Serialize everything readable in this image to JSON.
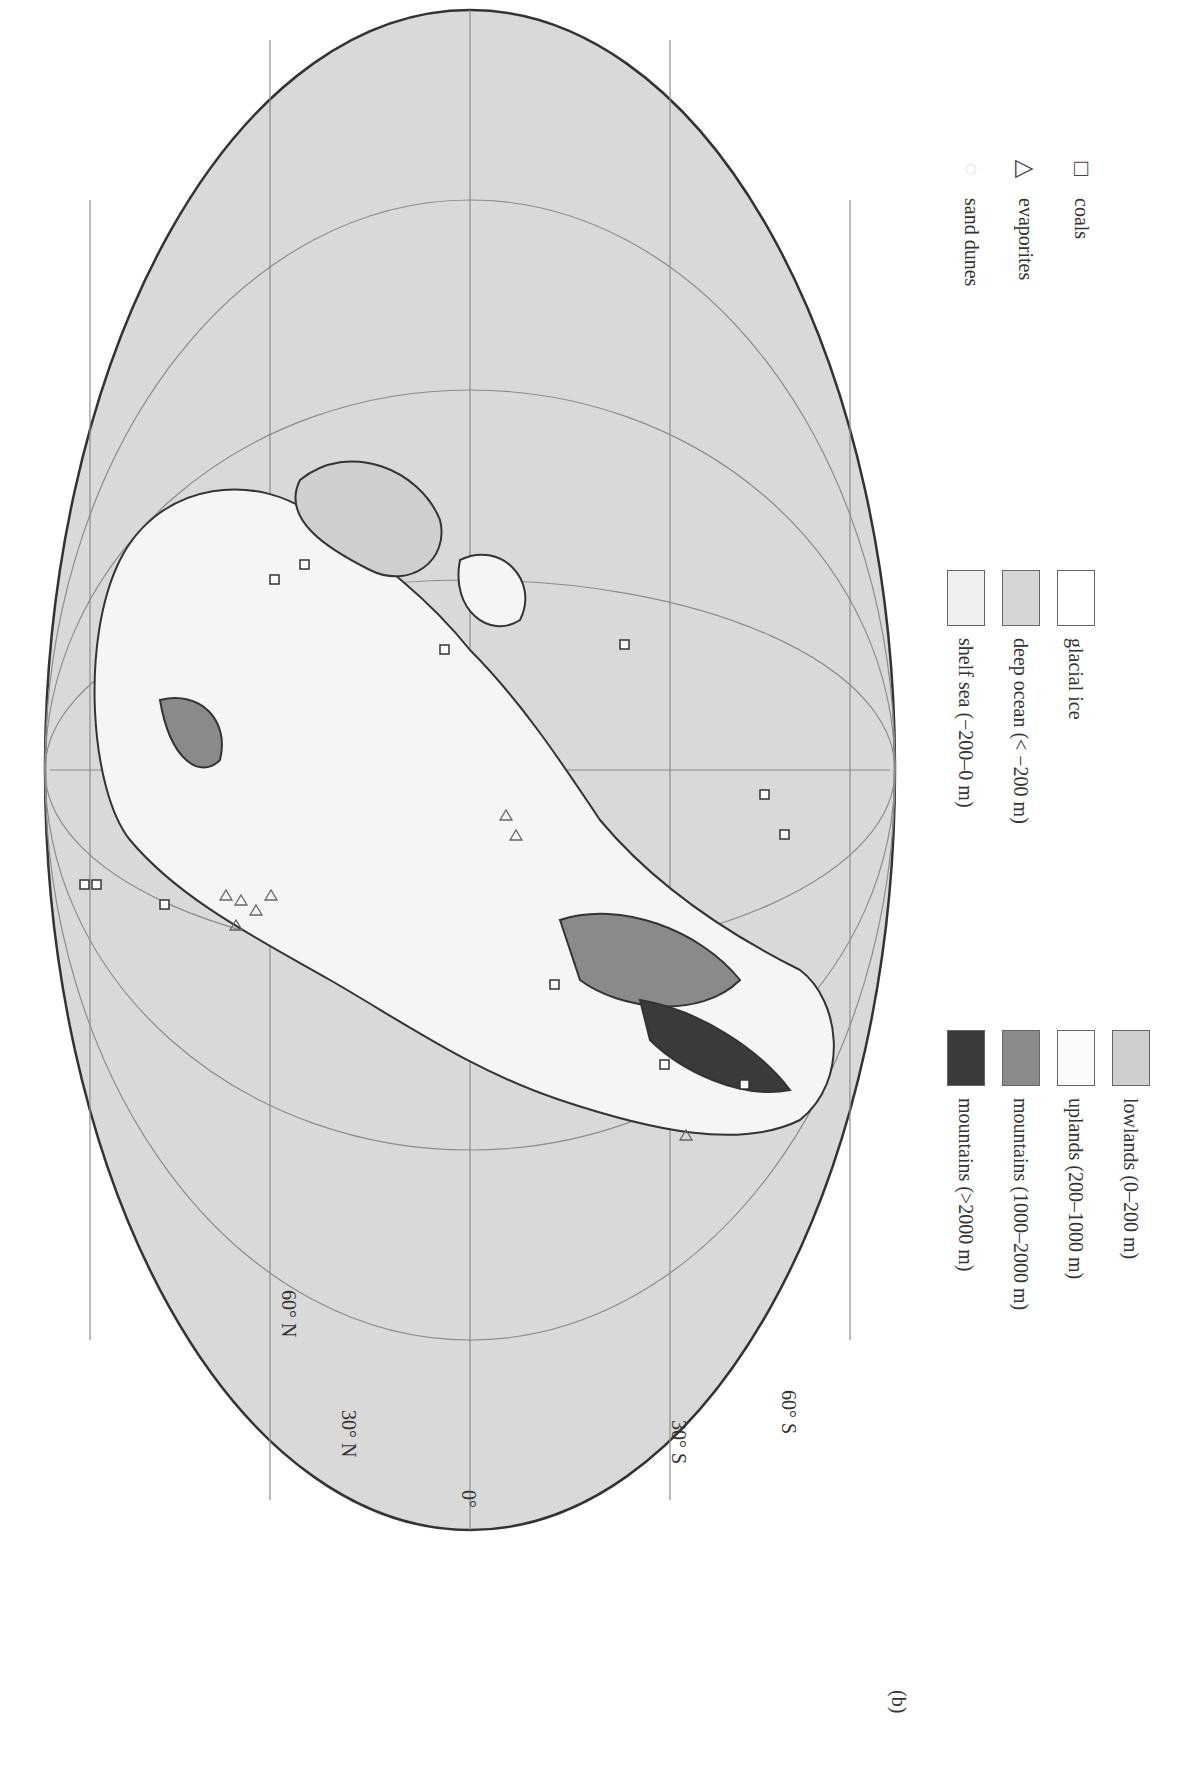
{
  "figure": {
    "panel_label": "(b)",
    "projection": "Mollweide",
    "orientation": "rotated 90 degrees clockwise",
    "latitude_labels": [
      "60° N",
      "30° N",
      "0°",
      "30° S",
      "60° S"
    ]
  },
  "legend": {
    "elevation": [
      {
        "label": "mountains (>2000 m)",
        "color": "#3a3a3a"
      },
      {
        "label": "mountains (1000–2000 m)",
        "color": "#8a8a8a"
      },
      {
        "label": "uplands (200–1000 m)",
        "color": "#fbfbfb"
      },
      {
        "label": "lowlands (0–200 m)",
        "color": "#cfcfcf"
      },
      {
        "label": "shelf sea (−200–0 m)",
        "color": "#efefef"
      },
      {
        "label": "deep ocean (< −200 m)",
        "color": "#d6d6d6"
      },
      {
        "label": "glacial ice",
        "color": "#ffffff"
      }
    ],
    "symbols": [
      {
        "label": "sand dunes",
        "icon": "circle"
      },
      {
        "label": "evaporites",
        "icon": "triangle"
      },
      {
        "label": "coals",
        "icon": "square"
      }
    ]
  },
  "colors": {
    "ocean": "#d9d9d9",
    "outline": "#333333",
    "graticule": "#8c8c8c"
  }
}
